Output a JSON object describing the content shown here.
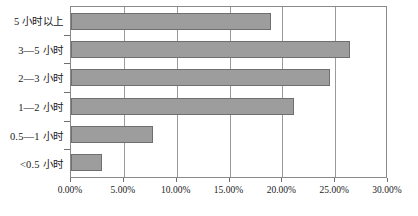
{
  "chart_data": {
    "type": "bar",
    "orientation": "horizontal",
    "title": "",
    "xlabel": "",
    "ylabel": "",
    "categories": [
      "5 小时以上",
      "3—5 小时",
      "2—3 小时",
      "1—2 小时",
      "0.5—1 小时",
      "<0.5 小时"
    ],
    "values": [
      18.9,
      26.4,
      24.5,
      21.1,
      7.8,
      2.9
    ],
    "value_labels": [
      "18.90%",
      "26.40%",
      "24.50%",
      "21.10%",
      "7.80%",
      "2.90%"
    ],
    "xlim": [
      0,
      30
    ],
    "xticks": [
      0,
      5,
      10,
      15,
      20,
      25,
      30
    ],
    "xtick_labels": [
      "0.00%",
      "5.00%",
      "10.00%",
      "15.00%",
      "20.00%",
      "25.00%",
      "30.00%"
    ],
    "grid": true,
    "grid_axis": "x",
    "legend": false,
    "series": [
      {
        "name": "占比",
        "values": [
          18.9,
          26.4,
          24.5,
          21.1,
          7.8,
          2.9
        ],
        "color": "#9d9d9d",
        "border_color": "#6f6f6f"
      }
    ],
    "colors": {
      "bar_fill": "#9d9d9d",
      "bar_border": "#6f6f6f",
      "grid": "#9a9a9a",
      "axis": "#8a8a8a",
      "text": "#1a1a1a",
      "background": "#ffffff"
    }
  }
}
